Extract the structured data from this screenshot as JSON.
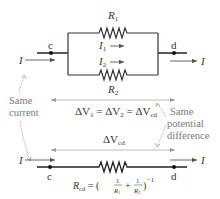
{
  "diagram": {
    "parallel_circuit": {
      "resistor_top_label": "R",
      "resistor_top_sub": "1",
      "resistor_bottom_label": "R",
      "resistor_bottom_sub": "2",
      "branch_current_1": "I",
      "branch_current_1_sub": "1",
      "branch_current_2": "I",
      "branch_current_2_sub": "2",
      "node_left": "c",
      "node_right": "d",
      "current_in": "I",
      "current_out": "I"
    },
    "voltage_equation": {
      "part1": "ΔV",
      "sub1": "1",
      "eq1": " = ΔV",
      "sub2": "2",
      "eq2": " = ΔV",
      "sub3": "cd"
    },
    "equivalent_voltage": {
      "label": "ΔV",
      "sub": "cd"
    },
    "equivalent_circuit": {
      "node_left": "c",
      "node_right": "d",
      "current_in": "I",
      "current_out": "I",
      "resistance_label": "R",
      "resistance_sub": "cd",
      "formula_eq": " = (",
      "frac1_num": "1",
      "frac1_den": "R",
      "frac1_den_sub": "1",
      "plus": "+",
      "frac2_num": "1",
      "frac2_den": "R",
      "frac2_den_sub": "2",
      "close": ")",
      "exponent": "−1"
    },
    "annotations": {
      "same_current_line1": "Same",
      "same_current_line2": "current",
      "same_potential_line1": "Same",
      "same_potential_line2": "potential",
      "same_potential_line3": "difference"
    },
    "colors": {
      "wire": "#333333",
      "arrow": "#8a8a8a",
      "dotted": "#8a8a8a",
      "annotation_text": "#7a7a7a"
    }
  }
}
